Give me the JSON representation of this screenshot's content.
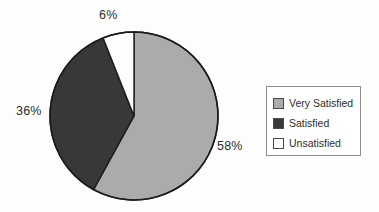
{
  "chart_data": {
    "type": "pie",
    "title": "",
    "subtitle": "",
    "xlabel": "",
    "ylabel": "",
    "grid": false,
    "legend_position": "right",
    "start_angle_deg": 0,
    "direction": "clockwise",
    "categories": [
      "Very Satisfied",
      "Satisfied",
      "Unsatisfied"
    ],
    "values": [
      58,
      36,
      6
    ],
    "unit": "%",
    "slices": [
      {
        "label": "Very Satisfied",
        "value": 58,
        "data_label": "58%",
        "color": "#ababab",
        "stroke": "#1c1c1c"
      },
      {
        "label": "Satisfied",
        "value": 36,
        "data_label": "36%",
        "color": "#383838",
        "stroke": "#1c1c1c"
      },
      {
        "label": "Unsatisfied",
        "value": 6,
        "data_label": "6%",
        "color": "#fdfdfd",
        "stroke": "#1c1c1c"
      }
    ]
  },
  "labels": {
    "top": "6%",
    "left": "36%",
    "right": "58%"
  },
  "legend": {
    "items": [
      {
        "label": "Very Satisfied",
        "color": "#ababab"
      },
      {
        "label": "Satisfied",
        "color": "#383838"
      },
      {
        "label": "Unsatisfied",
        "color": "#ffffff"
      }
    ]
  },
  "colors": {
    "background": "#fdfdfd",
    "outline": "#1c1c1c",
    "legend_border": "#8d8d8d",
    "text": "#2e2e2e"
  }
}
